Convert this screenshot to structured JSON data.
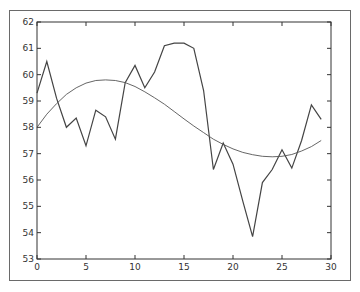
{
  "chart_data": {
    "type": "line",
    "title": "",
    "xlabel": "",
    "ylabel": "",
    "xlim": [
      0,
      30
    ],
    "ylim": [
      53,
      62
    ],
    "grid": false,
    "legend": null,
    "x_ticks": [
      "0",
      "5",
      "10",
      "15",
      "20",
      "25",
      "30"
    ],
    "y_ticks": [
      "53",
      "54",
      "55",
      "56",
      "57",
      "58",
      "59",
      "60",
      "61",
      "62"
    ],
    "series": [
      {
        "name": "data",
        "x": [
          0,
          1,
          2,
          3,
          4,
          5,
          6,
          7,
          8,
          9,
          10,
          11,
          12,
          13,
          14,
          15,
          16,
          17,
          18,
          19,
          20,
          21,
          22,
          23,
          24,
          25,
          26,
          27,
          28,
          29
        ],
        "values": [
          59.3,
          60.5,
          59.1,
          58.0,
          58.35,
          57.3,
          58.65,
          58.4,
          57.55,
          59.7,
          60.35,
          59.5,
          60.1,
          61.1,
          61.2,
          61.2,
          61.0,
          59.4,
          56.4,
          57.4,
          56.6,
          55.2,
          53.85,
          55.9,
          56.4,
          57.15,
          56.45,
          57.5,
          58.85,
          58.3
        ],
        "color": "#444444"
      },
      {
        "name": "fit",
        "x": [
          0,
          1,
          2,
          3,
          4,
          5,
          6,
          7,
          8,
          9,
          10,
          11,
          12,
          13,
          14,
          15,
          16,
          17,
          18,
          19,
          20,
          21,
          22,
          23,
          24,
          25,
          26,
          27,
          28,
          29
        ],
        "values": [
          58.0,
          58.5,
          58.9,
          59.25,
          59.5,
          59.68,
          59.78,
          59.8,
          59.78,
          59.7,
          59.55,
          59.35,
          59.12,
          58.88,
          58.6,
          58.32,
          58.05,
          57.8,
          57.55,
          57.35,
          57.18,
          57.05,
          56.96,
          56.9,
          56.88,
          56.9,
          56.97,
          57.1,
          57.27,
          57.5
        ],
        "color": "#555555"
      }
    ]
  }
}
